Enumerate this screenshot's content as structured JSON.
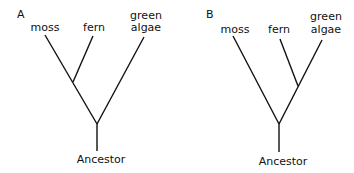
{
  "trees": [
    {
      "panel": "A",
      "taxa": {
        "moss": "moss",
        "fern": "fern",
        "algae_line1": "green",
        "algae_line2": "algae"
      },
      "root": "Ancestor",
      "topology": "((moss, fern), green algae)"
    },
    {
      "panel": "B",
      "taxa": {
        "moss": "moss",
        "fern": "fern",
        "algae_line1": "green",
        "algae_line2": "algae"
      },
      "root": "Ancestor",
      "topology": "(moss, (fern, green algae))"
    }
  ]
}
